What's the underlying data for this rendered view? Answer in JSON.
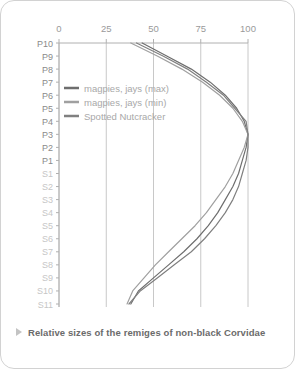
{
  "caption": {
    "bullet_icon": "triangle-right-icon",
    "text": "Relative sizes of the remiges of non-black Corvidae"
  },
  "colors": {
    "series_max": "#6e6e6e",
    "series_min": "#a0a0a0",
    "series_nutcracker": "#808080",
    "grid": "#c8c8c8",
    "axis": "#b0b0b0",
    "label_primary": "#8a8a8a",
    "label_secondary": "#c6c6c6",
    "card_border": "#d2d2d2",
    "caption_text": "#6b6b6b"
  },
  "legend": {
    "position": "inside-top-left",
    "items": [
      {
        "label": "magpies, jays (max)",
        "color": "#6e6e6e"
      },
      {
        "label": "magpies, jays (min)",
        "color": "#a0a0a0"
      },
      {
        "label": "Spotted Nutcracker",
        "color": "#808080"
      }
    ]
  },
  "chart_data": {
    "type": "line",
    "orientation": "horizontal",
    "title": "Relative sizes of the remiges of non-black Corvidae",
    "xlabel": "",
    "ylabel": "",
    "xlim": [
      0,
      105
    ],
    "ylim_categories_top_to_bottom": true,
    "grid": true,
    "xticks": [
      0,
      25,
      50,
      75,
      100
    ],
    "xtick_labels": [
      "0",
      "25",
      "50",
      "75",
      "100"
    ],
    "categories": [
      "P10",
      "P9",
      "P8",
      "P7",
      "P6",
      "P5",
      "P4",
      "P3",
      "P2",
      "P1",
      "S1",
      "S2",
      "S3",
      "S4",
      "S5",
      "S6",
      "S7",
      "S8",
      "S9",
      "S10",
      "S11"
    ],
    "category_groups": [
      {
        "name": "primaries",
        "labels": [
          "P10",
          "P9",
          "P8",
          "P7",
          "P6",
          "P5",
          "P4",
          "P3",
          "P2",
          "P1"
        ],
        "emphasis": "primary"
      },
      {
        "name": "secondaries",
        "labels": [
          "S1",
          "S2",
          "S3",
          "S4",
          "S5",
          "S6",
          "S7",
          "S8",
          "S9",
          "S10",
          "S11"
        ],
        "emphasis": "secondary"
      }
    ],
    "series": [
      {
        "name": "magpies, jays (max)",
        "color": "#6e6e6e",
        "values": [
          44,
          57,
          70,
          80,
          88,
          94,
          98,
          100,
          99,
          97,
          95,
          92,
          88,
          84,
          79,
          73,
          66,
          58,
          50,
          42,
          38
        ]
      },
      {
        "name": "magpies, jays (min)",
        "color": "#a0a0a0",
        "values": [
          38,
          52,
          65,
          76,
          85,
          92,
          97,
          100,
          98,
          95,
          92,
          88,
          83,
          78,
          72,
          65,
          58,
          51,
          45,
          39,
          36
        ]
      },
      {
        "name": "Spotted Nutcracker",
        "color": "#808080",
        "values": [
          41,
          55,
          68,
          78,
          87,
          93,
          99,
          100,
          100,
          99,
          97,
          95,
          92,
          88,
          83,
          77,
          70,
          61,
          52,
          43,
          37
        ]
      }
    ]
  }
}
